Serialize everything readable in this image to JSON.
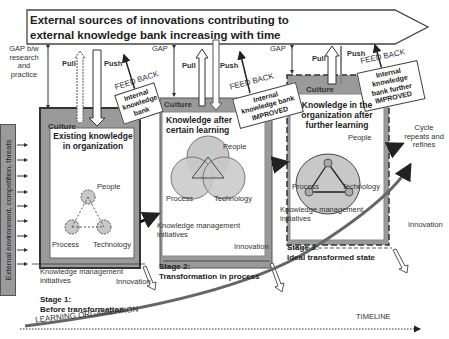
{
  "banner": {
    "line1": "External sources of innovations contributing to",
    "line2": "external knowledge bank increasing with time"
  },
  "side_label": "External environment, competition, threats",
  "gap_labels": {
    "first": "GAP b/w research and practice",
    "second": "GAP",
    "third": "GAP"
  },
  "flows": {
    "pull": "Pull",
    "push": "Push",
    "feedback": "FEED BACK"
  },
  "feedback_boxes": [
    {
      "text": "Internal knowledge bank"
    },
    {
      "text": "Internal knowledge bank IMPROVED"
    },
    {
      "text": "Internal knowledge bank further IMPROVED"
    }
  ],
  "stages": [
    {
      "culture": "Culture",
      "title": "Existing knowledge in organization",
      "people": "People",
      "process": "Process",
      "technology": "Technology",
      "km": "Knowledge management initiatives",
      "innovation": "Innovation",
      "stage_label": "Stage 1:",
      "stage_desc": "Before transformation"
    },
    {
      "culture": "Culture",
      "title": "Knowledge after certain learning",
      "people": "People",
      "process": "Process",
      "technology": "Technology",
      "km": "Knowledge management initiatives",
      "innovation": "Innovation",
      "stage_label": "Stage 2:",
      "stage_desc": "Transformation in process"
    },
    {
      "culture": "Culture",
      "title": "Knowledge in the organization after further learning",
      "people": "People",
      "process": "Process",
      "technology": "Technology",
      "km": "Knowledge management initiatives",
      "innovation": "Innovation",
      "stage_label": "Stage 3:",
      "stage_desc": "Ideal transformed state"
    }
  ],
  "cycle": "Cycle repeats and refines",
  "learning_org": "LEARNING ORGANIZATION",
  "timeline": "TIMELINE",
  "colors": {
    "culture_fill": "#9a9a9a",
    "inner_fill": "#ffffff",
    "circle_fill": "#c8c8c8",
    "line": "#333333"
  }
}
